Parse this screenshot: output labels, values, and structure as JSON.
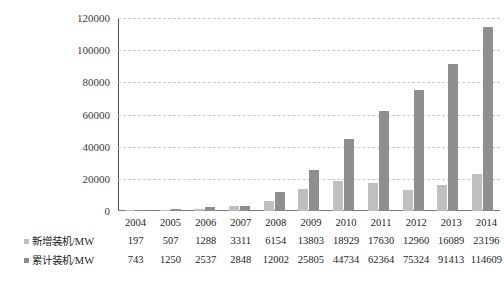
{
  "chart_data": {
    "type": "bar",
    "title": "",
    "xlabel": "",
    "ylabel": "",
    "ylim": [
      0,
      120000
    ],
    "yticks": [
      0,
      20000,
      40000,
      60000,
      80000,
      100000,
      120000
    ],
    "ytick_labels": [
      "0",
      "20000",
      "40000",
      "60000",
      "80000",
      "100000",
      "120000"
    ],
    "grid": true,
    "legend_position": "left-table",
    "categories": [
      "2004",
      "2005",
      "2006",
      "2007",
      "2008",
      "2009",
      "2010",
      "2011",
      "2012",
      "2013",
      "2014"
    ],
    "series": [
      {
        "name": "新增装机/MW",
        "color": "#bfbfbf",
        "values": [
          197,
          507,
          1288,
          3311,
          6154,
          13803,
          18929,
          17630,
          12960,
          16089,
          23196
        ]
      },
      {
        "name": "累计装机/MW",
        "color": "#8f8f8f",
        "values": [
          743,
          1250,
          2537,
          2848,
          12002,
          25805,
          44734,
          62364,
          75324,
          91413,
          114609
        ]
      }
    ]
  },
  "table": {
    "year_row_head": "",
    "rows": [
      {
        "label": "新增装机/MW",
        "swatch": "series-new",
        "values": [
          "197",
          "507",
          "1288",
          "3311",
          "6154",
          "13803",
          "18929",
          "17630",
          "12960",
          "16089",
          "23196"
        ]
      },
      {
        "label": "累计装机/MW",
        "swatch": "series-cum",
        "values": [
          "743",
          "1250",
          "2537",
          "2848",
          "12002",
          "25805",
          "44734",
          "62364",
          "75324",
          "91413",
          "114609"
        ]
      }
    ]
  }
}
